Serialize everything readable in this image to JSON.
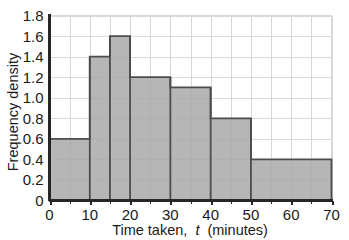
{
  "chart_data": {
    "type": "bar",
    "title": "",
    "subtitle": "",
    "xlabel_prefix": "Time taken,",
    "xlabel_variable": "t",
    "xlabel_suffix": "(minutes)",
    "xlabel": "Time taken, t (minutes)",
    "ylabel": "Frequency density",
    "xlim": [
      0,
      70
    ],
    "ylim": [
      0,
      1.8
    ],
    "grid": true,
    "legend": "none",
    "x_major_step": 10,
    "x_minor_step": 5,
    "y_major_step": 0.2,
    "xticks": [
      "0",
      "10",
      "20",
      "30",
      "40",
      "50",
      "60",
      "70"
    ],
    "xtick_values": [
      0,
      10,
      20,
      30,
      40,
      50,
      60,
      70
    ],
    "yticks": [
      "0",
      "0.2",
      "0.4",
      "0.6",
      "0.8",
      "1.0",
      "1.2",
      "1.4",
      "1.6",
      "1.8"
    ],
    "ytick_values": [
      0,
      0.2,
      0.4,
      0.6,
      0.8,
      1.0,
      1.2,
      1.4,
      1.6,
      1.8
    ],
    "bar_fill_color": "#a9a9a9",
    "bar_edge_color": "#4d4d4d",
    "grid_color": "#d8d8d8",
    "axis_color": "#262626",
    "background_color": "#ffffff",
    "bins": [
      {
        "label": "0-10",
        "x0": 0,
        "x1": 10,
        "value": 0.6
      },
      {
        "label": "10-15",
        "x0": 10,
        "x1": 15,
        "value": 1.4
      },
      {
        "label": "15-20",
        "x0": 15,
        "x1": 20,
        "value": 1.6
      },
      {
        "label": "20-30",
        "x0": 20,
        "x1": 30,
        "value": 1.2
      },
      {
        "label": "30-40",
        "x0": 30,
        "x1": 40,
        "value": 1.1
      },
      {
        "label": "40-50",
        "x0": 40,
        "x1": 50,
        "value": 0.8
      },
      {
        "label": "50-70",
        "x0": 50,
        "x1": 70,
        "value": 0.4
      }
    ],
    "categories": [
      "0-10",
      "10-15",
      "15-20",
      "20-30",
      "30-40",
      "40-50",
      "50-70"
    ],
    "values": [
      0.6,
      1.4,
      1.6,
      1.2,
      1.1,
      0.8,
      0.4
    ]
  }
}
